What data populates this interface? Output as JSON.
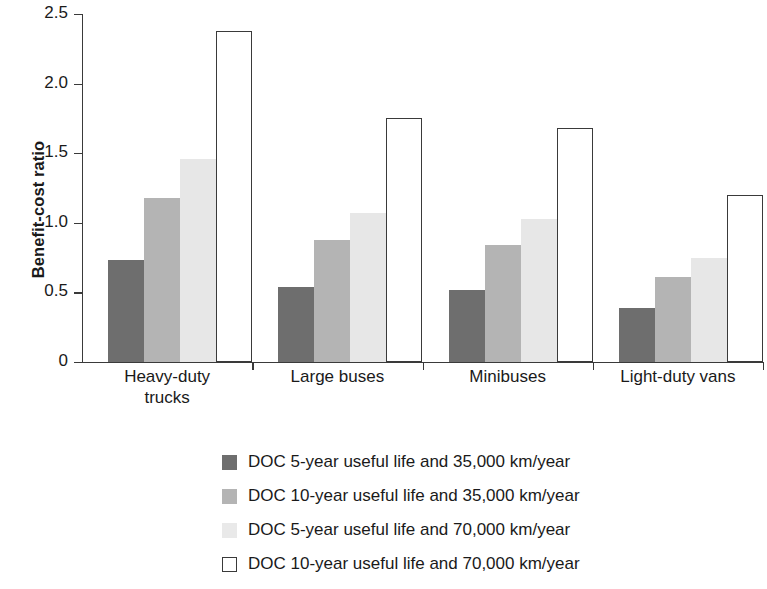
{
  "chart_data": {
    "type": "bar",
    "title": "",
    "xlabel": "",
    "ylabel": "Benefit-cost ratio",
    "ylim": [
      0,
      2.5
    ],
    "yticks": [
      "0",
      "0.5",
      "1.0",
      "1.5",
      "2.0",
      "2.5"
    ],
    "ytick_values": [
      0,
      0.5,
      1.0,
      1.5,
      2.0,
      2.5
    ],
    "grid": false,
    "legend_position": "bottom",
    "categories": [
      "Heavy-duty trucks",
      "Large buses",
      "Minibuses",
      "Light-duty vans"
    ],
    "category_lines": [
      [
        "Heavy-duty",
        "trucks"
      ],
      [
        "Large buses"
      ],
      [
        "Minibuses"
      ],
      [
        "Light-duty vans"
      ]
    ],
    "series": [
      {
        "name": "DOC 5-year useful life and 35,000 km/year",
        "color": "#6e6e6e",
        "values": [
          0.73,
          0.54,
          0.52,
          0.39
        ]
      },
      {
        "name": "DOC 10-year useful life and 35,000 km/year",
        "color": "#b4b4b4",
        "values": [
          1.18,
          0.88,
          0.84,
          0.61
        ]
      },
      {
        "name": "DOC 5-year useful life and 70,000 km/year",
        "color": "#e7e7e7",
        "values": [
          1.46,
          1.07,
          1.03,
          0.75
        ]
      },
      {
        "name": "DOC 10-year useful life and 70,000 km/year",
        "color": "#ffffff",
        "values": [
          2.38,
          1.75,
          1.68,
          1.2
        ]
      }
    ]
  },
  "axis": {
    "line_color": "#3a3a3a"
  }
}
